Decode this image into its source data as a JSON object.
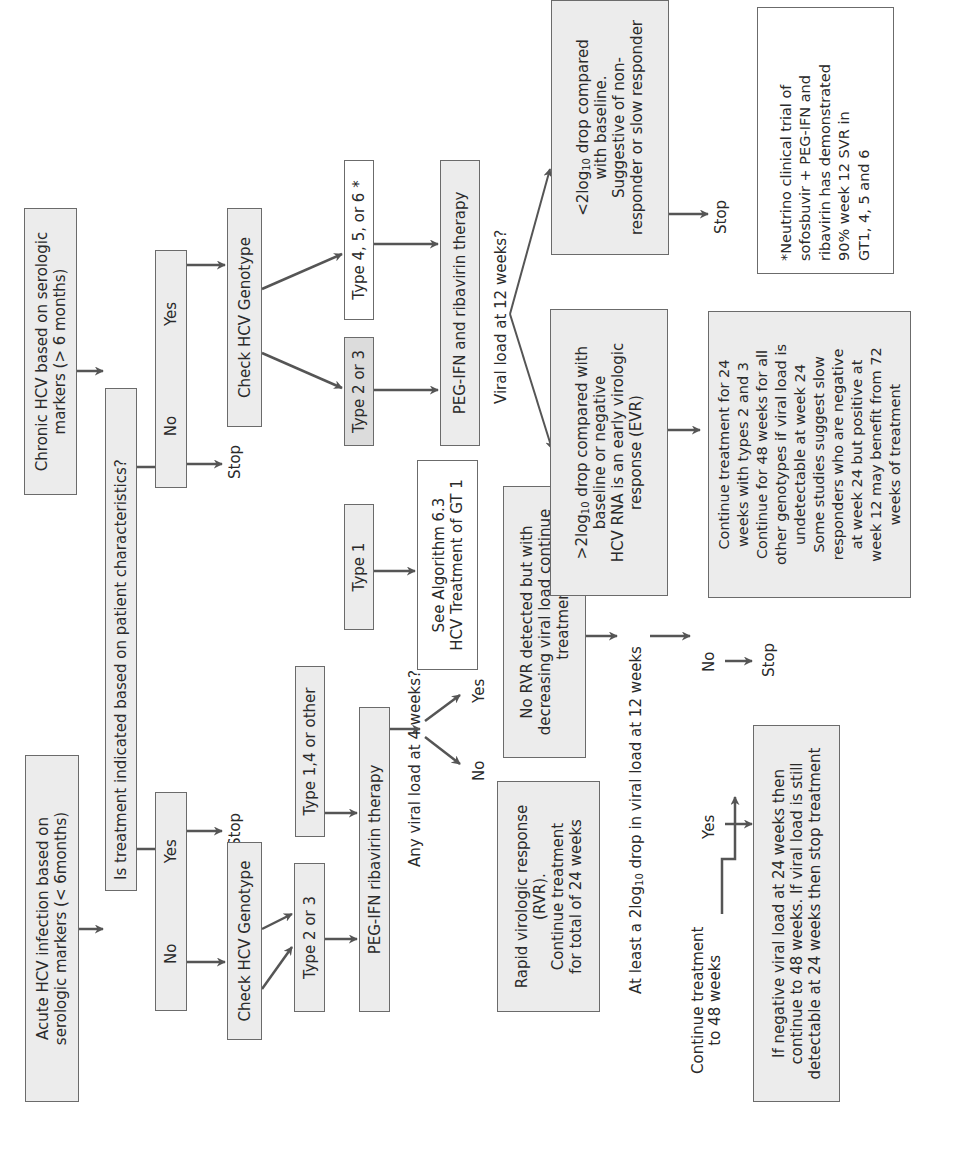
{
  "diagram": {
    "type": "flowchart",
    "orientation": "rotated-90-ccw",
    "colors": {
      "box_fill": "#ececec",
      "box_border": "#6b6b6b",
      "arrow": "#555555",
      "text": "#2a2a2a",
      "background": "#ffffff"
    }
  },
  "acute": {
    "start": "Acute HCV infection based on serologic markers (< 6months)",
    "start_line1": "Acute HCV infection based on",
    "start_line2": "serologic markers (< 6months)",
    "yes": "Yes",
    "no": "No",
    "stop": "Stop",
    "check_genotype": "Check HCV Genotype",
    "type_2_3": "Type 2 or 3",
    "type_1_4_other": "Type 1,4 or other",
    "therapy": "PEG-IFN ribavirin therapy",
    "question_4wk": "Any viral load at 4 weeks?",
    "q4_yes": "Yes",
    "q4_no": "No",
    "rvr_line1": "Rapid virologic response",
    "rvr_line2": "(RVR).",
    "rvr_line3": "Continue treatment",
    "rvr_line4": "for total of 24 weeks",
    "no_rvr_line1": "No RVR detected but with",
    "no_rvr_line2": "decreasing viral load continue",
    "no_rvr_line3": "treatment",
    "question_12wk_prefix": "At least a 2log",
    "question_12wk_sub": "10",
    "question_12wk_suffix": " drop in viral load at 12 weeks",
    "q12_no": "No",
    "q12_stop": "Stop",
    "q12_yes": "Yes",
    "continue48_line1": "Continue treatment",
    "continue48_line2": "to 48 weeks",
    "final_line1": "If negative viral load at 24 weeks then",
    "final_line2": "continue to 48 weeks. If viral load is still",
    "final_line3": "detectable at 24 weeks then stop treatment"
  },
  "shared": {
    "treatment_question": "Is treatment indicated based on patient characteristics?"
  },
  "chronic": {
    "start_line1": "Chronic HCV based on serologic",
    "start_line2": "markers (> 6 months)",
    "yes": "Yes",
    "no": "No",
    "stop": "Stop",
    "check_genotype": "Check HCV Genotype",
    "type_2_3": "Type 2 or 3",
    "type_4_5_6": "Type 4, 5, or 6 *",
    "type_1": "Type 1",
    "see_alg_line1": "See Algorithm 6.3",
    "see_alg_line2": "HCV Treatment of GT 1",
    "therapy": "PEG-IFN and ribavirin therapy",
    "question_12wk": "Viral load at 12 weeks?",
    "evr_line1_prefix": ">2log",
    "evr_line1_sub": "10",
    "evr_line1_suffix": " drop compared with",
    "evr_line2": "baseline or negative",
    "evr_line3": "HCV RNA is an early virologic",
    "evr_line4": "response (EVR)",
    "slow_line1_prefix": "<2log",
    "slow_line1_sub": "10",
    "slow_line1_suffix": " drop compared",
    "slow_line2": "with baseline.",
    "slow_line3": "Suggestive of non-",
    "slow_line4": "responder or slow responder",
    "slow_stop": "Stop",
    "continue_lines": [
      "Continue treatment for 24",
      "weeks with types 2 and 3",
      "Continue for 48 weeks for all",
      "other genotypes if viral load is",
      "undetectable at week 24",
      "Some studies suggest slow",
      "responders who are negative",
      "at week 24 but positive at",
      "week 12 may benefit from 72",
      "weeks of treatment"
    ],
    "footnote_lines": [
      "*Neutrino clinical trial of",
      "sofosbuvir + PEG-IFN and",
      "ribavirin has demonstrated",
      "90% week 12 SVR in",
      "GT1, 4, 5 and 6"
    ]
  }
}
